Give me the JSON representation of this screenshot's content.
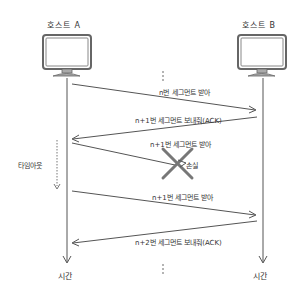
{
  "hosts": {
    "a": {
      "label": "호스트 A"
    },
    "b": {
      "label": "호스트 B"
    }
  },
  "messages": [
    {
      "label": "n번 세그먼트 받아",
      "direction": "A→B"
    },
    {
      "label": "n+1번 세그먼트 보내줘(ACK)",
      "direction": "B→A"
    },
    {
      "label": "n+1번 세그먼트 받아",
      "direction": "A→B",
      "lost": true
    },
    {
      "label": "n+1번 세그먼트 받아",
      "direction": "A→B"
    },
    {
      "label": "n+2번 세그먼트 보내줘(ACK)",
      "direction": "B→A"
    }
  ],
  "loss_label": "손실",
  "timeout_label": "타임아웃",
  "time_label_a": "시간",
  "time_label_b": "시간",
  "colors": {
    "line": "#555555",
    "cross": "#777777",
    "screen": "#ffffff",
    "frame": "#666666",
    "stand": "#999999"
  }
}
